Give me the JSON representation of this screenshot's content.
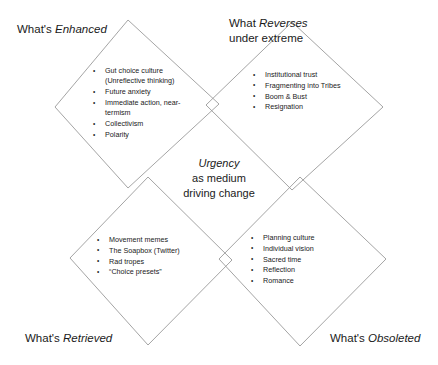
{
  "diagram": {
    "type": "mcluhan-tetrad",
    "center": {
      "title": "Urgency",
      "subtitle_line1": "as medium",
      "subtitle_line2": "driving change"
    },
    "line_color": "#9a9a9a",
    "quadrants": [
      {
        "id": "enhanced",
        "label_prefix": "What's ",
        "label_emphasis": "Enhanced",
        "label_line2": "",
        "items": [
          "Gut choice culture (Unreflective thinking)",
          "Future anxiety",
          "Immediate action, near-termism",
          "Collectivism",
          "Polarity"
        ]
      },
      {
        "id": "reverses",
        "label_prefix": "What ",
        "label_emphasis": "Reverses",
        "label_line2": "under extreme",
        "items": [
          "Institutional trust",
          "Fragmenting into Tribes",
          "Boom & Bust",
          "Resignation"
        ]
      },
      {
        "id": "retrieved",
        "label_prefix": "What's ",
        "label_emphasis": "Retrieved",
        "label_line2": "",
        "items": [
          "Movement memes",
          "The Soapbox (Twitter)",
          "Rad tropes",
          "“Choice presets”"
        ]
      },
      {
        "id": "obsoleted",
        "label_prefix": "What's ",
        "label_emphasis": "Obsoleted",
        "label_line2": "",
        "items": [
          "Planning culture",
          "Individual vision",
          "Sacred time",
          "Reflection",
          "Romance"
        ]
      }
    ]
  }
}
